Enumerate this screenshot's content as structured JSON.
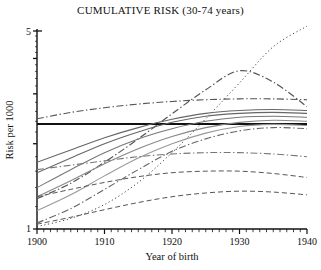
{
  "chart": {
    "title": "CUMULATIVE RISK (30-74 years)",
    "xlabel": "Year of birth",
    "ylabel": "Risk per 1000"
  },
  "axis": {
    "y_ticks": [
      "5",
      "1"
    ],
    "x_ticks": [
      "1900",
      "1910",
      "1920",
      "1930",
      "1940"
    ]
  },
  "chart_data": {
    "type": "line",
    "title": "CUMULATIVE RISK (30-74 years)",
    "xlabel": "Year of birth",
    "ylabel": "Risk per 1000",
    "xlim": [
      1900,
      1940
    ],
    "ylim": [
      1,
      5
    ],
    "yscale": "log",
    "y_tick_values": [
      1,
      2,
      3,
      4,
      5
    ],
    "y_labeled_ticks": [
      1,
      5
    ],
    "x_tick_values": [
      1900,
      1910,
      1920,
      1930,
      1940
    ],
    "x_minor_tick_step": 1,
    "grid": false,
    "legend": null,
    "x": [
      1900,
      1905,
      1910,
      1915,
      1920,
      1925,
      1930,
      1935,
      1940
    ],
    "series": [
      {
        "name": "series-1",
        "style": "solid-thick-horizontal",
        "color": "#111111",
        "width": 2.0,
        "values": [
          2.35,
          2.35,
          2.35,
          2.35,
          2.35,
          2.35,
          2.35,
          2.35,
          2.35
        ]
      },
      {
        "name": "series-2",
        "style": "dashdot",
        "color": "#555555",
        "width": 1.1,
        "values": [
          2.45,
          2.58,
          2.68,
          2.76,
          2.82,
          2.86,
          2.88,
          2.88,
          2.86
        ]
      },
      {
        "name": "series-3",
        "style": "dashdot",
        "color": "#555555",
        "width": 1.2,
        "values": [
          1.28,
          1.45,
          1.72,
          2.08,
          2.55,
          3.1,
          3.62,
          3.3,
          2.7
        ]
      },
      {
        "name": "series-4",
        "style": "dotted",
        "color": "#444444",
        "width": 1.0,
        "values": [
          1.02,
          1.09,
          1.22,
          1.46,
          1.86,
          2.45,
          3.28,
          4.4,
          5.2
        ]
      },
      {
        "name": "series-5",
        "style": "solid",
        "color": "#666666",
        "width": 1.1,
        "values": [
          1.72,
          1.9,
          2.1,
          2.28,
          2.44,
          2.56,
          2.62,
          2.64,
          2.62
        ]
      },
      {
        "name": "series-6",
        "style": "solid",
        "color": "#666666",
        "width": 1.1,
        "values": [
          1.58,
          1.78,
          2.0,
          2.2,
          2.38,
          2.5,
          2.56,
          2.58,
          2.56
        ]
      },
      {
        "name": "series-7",
        "style": "solid",
        "color": "#777777",
        "width": 1.1,
        "values": [
          1.4,
          1.62,
          1.86,
          2.08,
          2.26,
          2.4,
          2.48,
          2.5,
          2.48
        ]
      },
      {
        "name": "series-8",
        "style": "solid",
        "color": "#888888",
        "width": 1.1,
        "values": [
          1.3,
          1.48,
          1.7,
          1.92,
          2.12,
          2.28,
          2.38,
          2.42,
          2.4
        ]
      },
      {
        "name": "series-9",
        "style": "solid",
        "color": "#999999",
        "width": 1.1,
        "values": [
          1.16,
          1.32,
          1.54,
          1.78,
          2.0,
          2.18,
          2.3,
          2.34,
          2.32
        ]
      },
      {
        "name": "series-10",
        "style": "dashdot",
        "color": "#666666",
        "width": 1.1,
        "values": [
          1.05,
          1.18,
          1.38,
          1.62,
          1.88,
          2.08,
          2.22,
          2.28,
          2.26
        ]
      },
      {
        "name": "series-11",
        "style": "dashdot-flat",
        "color": "#777777",
        "width": 1.1,
        "values": [
          1.62,
          1.68,
          1.74,
          1.8,
          1.84,
          1.86,
          1.86,
          1.84,
          1.8
        ]
      },
      {
        "name": "series-12",
        "style": "dashed",
        "color": "#555555",
        "width": 1.0,
        "values": [
          1.3,
          1.38,
          1.46,
          1.53,
          1.58,
          1.6,
          1.6,
          1.57,
          1.52
        ]
      },
      {
        "name": "series-13",
        "style": "dashed",
        "color": "#555555",
        "width": 1.0,
        "values": [
          1.04,
          1.1,
          1.17,
          1.24,
          1.3,
          1.34,
          1.36,
          1.35,
          1.32
        ]
      }
    ]
  }
}
